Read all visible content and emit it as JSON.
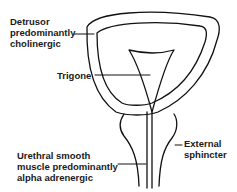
{
  "diagram": {
    "title": "",
    "labels": {
      "detrusor": [
        "Detrusor",
        "predominantly",
        "cholinergic"
      ],
      "trigone": "Trigone",
      "external_sphincter": [
        "External",
        "sphincter"
      ],
      "urethral": [
        "Urethral smooth",
        "muscle predominantly",
        "alpha adrenergic"
      ]
    },
    "colors": {
      "line": "#111111",
      "text": "#1a1a1a",
      "background": "#ffffff"
    }
  }
}
